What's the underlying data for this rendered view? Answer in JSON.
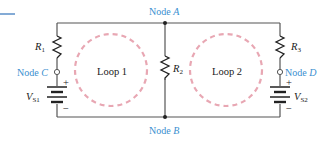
{
  "diagram": {
    "type": "circuit",
    "colors": {
      "wire": "#555555",
      "node_label": "#3a8fd0",
      "loop": "#e8a7b3",
      "text": "#1a1a1a",
      "accent_line": "#5b8fc9"
    },
    "nodes": {
      "a": {
        "prefix": "Node ",
        "letter": "A"
      },
      "b": {
        "prefix": "Node ",
        "letter": "B"
      },
      "c": {
        "prefix": "Node ",
        "letter": "C"
      },
      "d": {
        "prefix": "Node ",
        "letter": "D"
      }
    },
    "resistors": {
      "r1": {
        "letter": "R",
        "sub": "1"
      },
      "r2": {
        "letter": "R",
        "sub": "2"
      },
      "r3": {
        "letter": "R",
        "sub": "3"
      }
    },
    "sources": {
      "vs1": {
        "letter": "V",
        "sub": "S1",
        "plus": "+",
        "minus": "−"
      },
      "vs2": {
        "letter": "V",
        "sub": "S2",
        "plus": "+",
        "minus": "−"
      }
    },
    "loops": {
      "loop1": "Loop 1",
      "loop2": "Loop 2"
    }
  }
}
